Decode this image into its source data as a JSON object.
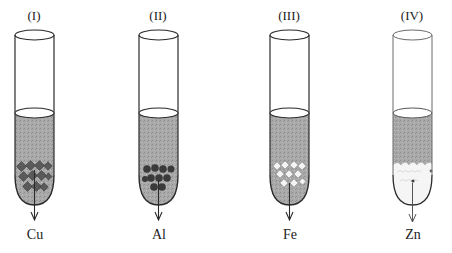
{
  "diagram": {
    "tubes": [
      {
        "numeral": "(I)",
        "metal": "Cu",
        "particle_shape": "diamond",
        "particle_color": "#555555"
      },
      {
        "numeral": "(II)",
        "metal": "Al",
        "particle_shape": "circle",
        "particle_color": "#3a3a3a"
      },
      {
        "numeral": "(III)",
        "metal": "Fe",
        "particle_shape": "diamond",
        "particle_color": "#f2f2f2"
      },
      {
        "numeral": "(IV)",
        "metal": "Zn",
        "particle_shape": "blob",
        "particle_color": "#f4f4f4"
      }
    ],
    "colors": {
      "outline": "#2a2a2a",
      "solution": "#a8a8a8",
      "background": "#ffffff"
    }
  }
}
